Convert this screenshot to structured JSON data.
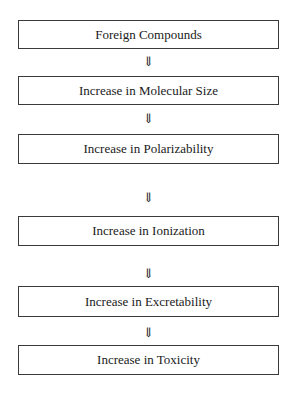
{
  "diagram": {
    "type": "flowchart",
    "direction": "top-to-bottom",
    "nodes": [
      {
        "id": "n1",
        "label": "Foreign Compounds"
      },
      {
        "id": "n2",
        "label": "Increase in Molecular Size"
      },
      {
        "id": "n3",
        "label": "Increase in Polarizability"
      },
      {
        "id": "n4",
        "label": "Increase in Ionization"
      },
      {
        "id": "n5",
        "label": "Increase in Excretability"
      },
      {
        "id": "n6",
        "label": "Increase in Toxicity"
      }
    ],
    "arrows": [
      {
        "from": "n1",
        "to": "n2",
        "glyph": "⇓"
      },
      {
        "from": "n2",
        "to": "n3",
        "glyph": "⇓"
      },
      {
        "from": "n3",
        "to": "n4",
        "glyph": "⇓"
      },
      {
        "from": "n4",
        "to": "n5",
        "glyph": "⇓"
      },
      {
        "from": "n5",
        "to": "n6",
        "glyph": "⇓"
      }
    ]
  }
}
